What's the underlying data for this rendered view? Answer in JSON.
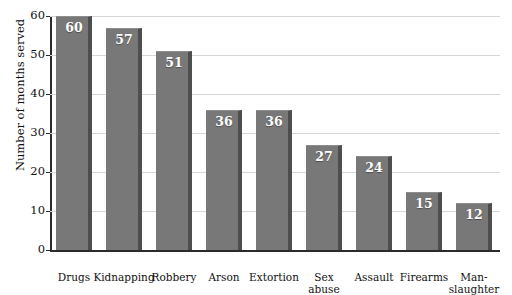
{
  "chart_data": {
    "type": "bar",
    "title": "",
    "xlabel": "",
    "ylabel": "Number of months served",
    "ylim": [
      0,
      60
    ],
    "yticks": [
      0,
      10,
      20,
      30,
      40,
      50,
      60
    ],
    "grid": true,
    "legend": "none",
    "categories": [
      "Drugs",
      "Kidnapping",
      "Robbery",
      "Arson",
      "Extortion",
      "Sex\nabuse",
      "Assault",
      "Firearms",
      "Man-\nslaughter"
    ],
    "category_lines": [
      [
        "Drugs"
      ],
      [
        "Kidnapping"
      ],
      [
        "Robbery"
      ],
      [
        "Arson"
      ],
      [
        "Extortion"
      ],
      [
        "Sex",
        "abuse"
      ],
      [
        "Assault"
      ],
      [
        "Firearms"
      ],
      [
        "Man-",
        "slaughter"
      ]
    ],
    "values": [
      60,
      57,
      51,
      36,
      36,
      27,
      24,
      15,
      12
    ],
    "data_labels": [
      "60",
      "57",
      "51",
      "36",
      "36",
      "27",
      "24",
      "15",
      "12"
    ],
    "colors": {
      "bar_fill": "#787878",
      "bar_shadow": "#4e4e4e",
      "gridline": "#d6d6d6",
      "axis": "#2b2b2b",
      "data_label": "#ffffff",
      "background": "#ffffff"
    }
  }
}
